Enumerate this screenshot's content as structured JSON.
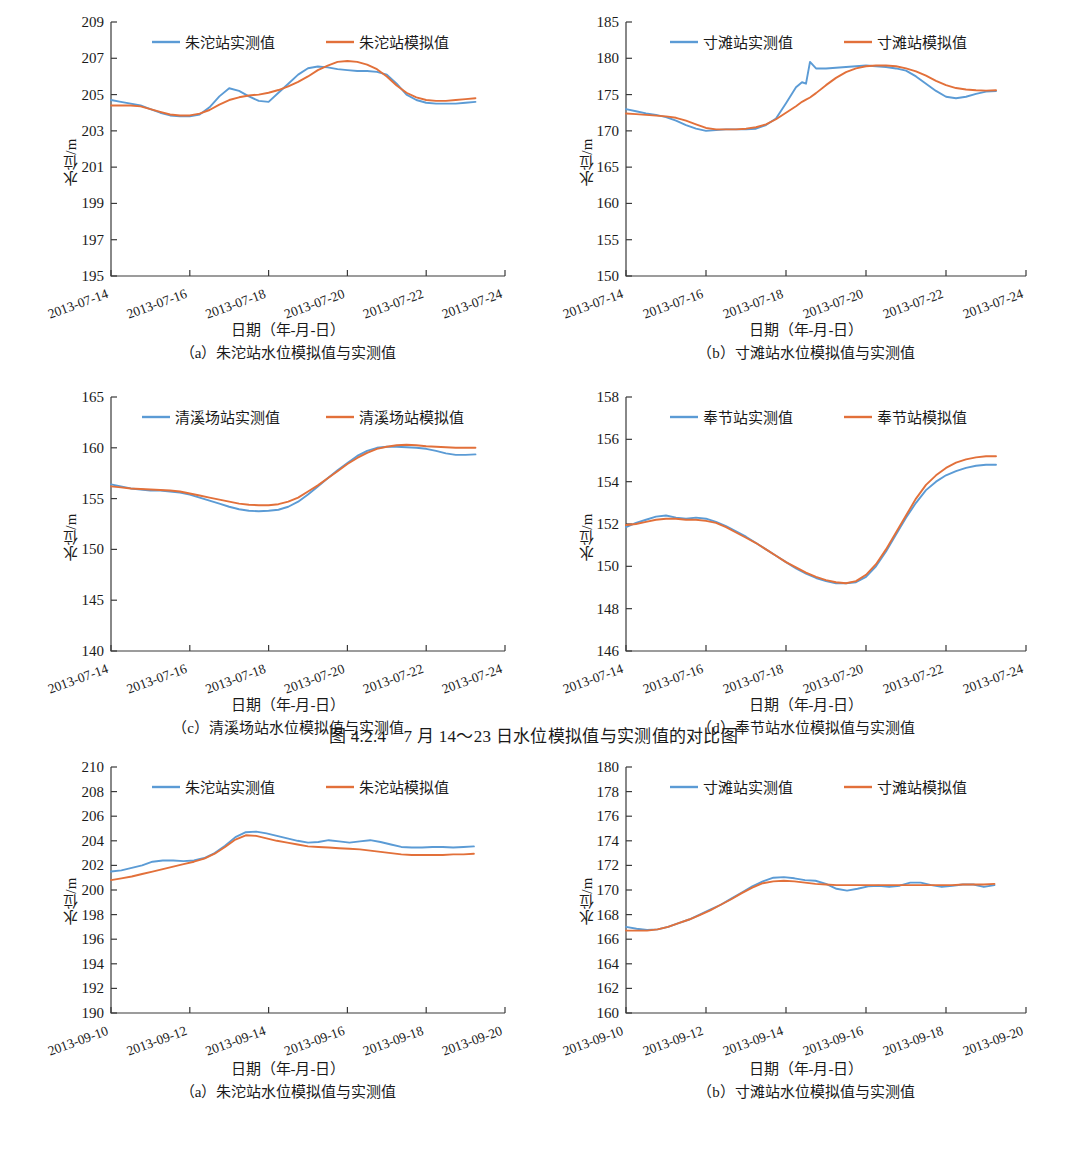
{
  "figure": {
    "title": "图 4.2.4　7 月 14～23 日水位模拟值与实测值的对比图",
    "axis_y_title": "水位/m",
    "axis_x_title": "日期（年-月-日）",
    "colors": {
      "observed": "#5B9BD5",
      "simulated": "#E2703A"
    }
  },
  "chart_data": [
    {
      "id": "a-zhutuo-july",
      "type": "line",
      "title": "",
      "caption": "（a）朱沱站水位模拟值与实测值",
      "xlabel": "日期（年-月-日）",
      "ylabel": "水位/m",
      "legend_position": "top-center",
      "grid": false,
      "ylim": [
        195,
        209
      ],
      "yticks": [
        195,
        197,
        199,
        201,
        203,
        205,
        207,
        209
      ],
      "xlim": [
        "2013-07-14",
        "2013-07-24"
      ],
      "xticks": [
        "2013-07-14",
        "2013-07-16",
        "2013-07-18",
        "2013-07-20",
        "2013-07-22",
        "2013-07-24"
      ],
      "x": [
        0,
        0.25,
        0.5,
        0.75,
        1,
        1.25,
        1.5,
        1.75,
        2,
        2.25,
        2.5,
        2.75,
        3,
        3.25,
        3.5,
        3.75,
        4,
        4.25,
        4.5,
        4.75,
        5,
        5.25,
        5.5,
        5.75,
        6,
        6.25,
        6.5,
        6.75,
        7,
        7.25,
        7.5,
        7.75,
        8,
        8.25,
        8.5,
        8.75,
        9,
        9.25
      ],
      "series": [
        {
          "name": "朱沱站实测值",
          "color": "#5B9BD5",
          "values": [
            204.7,
            204.6,
            204.5,
            204.4,
            204.2,
            204.0,
            203.85,
            203.8,
            203.8,
            203.9,
            204.3,
            204.9,
            205.35,
            205.2,
            204.9,
            204.65,
            204.6,
            205.1,
            205.6,
            206.1,
            206.45,
            206.55,
            206.5,
            206.4,
            206.35,
            206.3,
            206.3,
            206.25,
            206.1,
            205.6,
            205.0,
            204.7,
            204.55,
            204.5,
            204.5,
            204.5,
            204.55,
            204.6
          ]
        },
        {
          "name": "朱沱站模拟值",
          "color": "#E2703A",
          "values": [
            204.4,
            204.4,
            204.4,
            204.35,
            204.2,
            204.05,
            203.9,
            203.85,
            203.85,
            203.95,
            204.15,
            204.45,
            204.7,
            204.85,
            204.95,
            205.0,
            205.1,
            205.25,
            205.45,
            205.7,
            206.0,
            206.35,
            206.6,
            206.8,
            206.85,
            206.8,
            206.65,
            206.4,
            206.0,
            205.5,
            205.1,
            204.85,
            204.7,
            204.65,
            204.65,
            204.7,
            204.75,
            204.8
          ]
        }
      ]
    },
    {
      "id": "b-cuntan-july",
      "type": "line",
      "title": "",
      "caption": "（b）寸滩站水位模拟值与实测值",
      "xlabel": "日期（年-月-日）",
      "ylabel": "水位/m",
      "legend_position": "top-center",
      "grid": false,
      "ylim": [
        150,
        185
      ],
      "yticks": [
        150,
        155,
        160,
        165,
        170,
        175,
        180,
        185
      ],
      "xlim": [
        "2013-07-14",
        "2013-07-24"
      ],
      "xticks": [
        "2013-07-14",
        "2013-07-16",
        "2013-07-18",
        "2013-07-20",
        "2013-07-22",
        "2013-07-24"
      ],
      "x": [
        0,
        0.25,
        0.5,
        0.75,
        1,
        1.25,
        1.5,
        1.75,
        2,
        2.25,
        2.5,
        2.75,
        3,
        3.25,
        3.5,
        3.75,
        4,
        4.25,
        4.4,
        4.5,
        4.6,
        4.75,
        5,
        5.25,
        5.5,
        5.75,
        6,
        6.25,
        6.5,
        6.75,
        7,
        7.25,
        7.5,
        7.75,
        8,
        8.25,
        8.5,
        8.75,
        9,
        9.25
      ],
      "series": [
        {
          "name": "寸滩站实测值",
          "color": "#5B9BD5",
          "values": [
            173.0,
            172.7,
            172.4,
            172.2,
            171.9,
            171.4,
            170.8,
            170.3,
            170.0,
            170.1,
            170.2,
            170.2,
            170.2,
            170.3,
            170.8,
            171.7,
            173.8,
            176.0,
            176.7,
            176.5,
            179.5,
            178.6,
            178.6,
            178.7,
            178.8,
            178.9,
            179.0,
            178.9,
            178.8,
            178.6,
            178.3,
            177.5,
            176.5,
            175.5,
            174.7,
            174.5,
            174.7,
            175.1,
            175.4,
            175.5
          ]
        },
        {
          "name": "寸滩站模拟值",
          "color": "#E2703A",
          "values": [
            172.4,
            172.3,
            172.2,
            172.1,
            172.0,
            171.8,
            171.4,
            170.9,
            170.4,
            170.2,
            170.2,
            170.2,
            170.3,
            170.5,
            170.9,
            171.6,
            172.5,
            173.4,
            174.0,
            174.3,
            174.6,
            175.2,
            176.3,
            177.3,
            178.1,
            178.6,
            178.9,
            179.0,
            179.0,
            178.9,
            178.6,
            178.2,
            177.6,
            176.9,
            176.3,
            175.9,
            175.7,
            175.6,
            175.55,
            175.6
          ]
        }
      ]
    },
    {
      "id": "c-qingxichang-july",
      "type": "line",
      "title": "",
      "caption": "（c）清溪场站水位模拟值与实测值",
      "xlabel": "日期（年-月-日）",
      "ylabel": "水位/m",
      "legend_position": "top-center",
      "grid": false,
      "ylim": [
        140,
        165
      ],
      "yticks": [
        140,
        145,
        150,
        155,
        160,
        165
      ],
      "xlim": [
        "2013-07-14",
        "2013-07-24"
      ],
      "xticks": [
        "2013-07-14",
        "2013-07-16",
        "2013-07-18",
        "2013-07-20",
        "2013-07-22",
        "2013-07-24"
      ],
      "x": [
        0,
        0.25,
        0.5,
        0.75,
        1,
        1.25,
        1.5,
        1.75,
        2,
        2.25,
        2.5,
        2.75,
        3,
        3.25,
        3.5,
        3.75,
        4,
        4.25,
        4.5,
        4.75,
        5,
        5.25,
        5.5,
        5.75,
        6,
        6.25,
        6.5,
        6.75,
        7,
        7.25,
        7.5,
        7.75,
        8,
        8.25,
        8.5,
        8.75,
        9,
        9.25
      ],
      "series": [
        {
          "name": "清溪场站实测值",
          "color": "#5B9BD5",
          "values": [
            156.4,
            156.2,
            156.0,
            155.9,
            155.8,
            155.8,
            155.7,
            155.6,
            155.4,
            155.1,
            154.8,
            154.5,
            154.2,
            153.95,
            153.8,
            153.75,
            153.8,
            153.9,
            154.2,
            154.7,
            155.4,
            156.2,
            157.0,
            157.8,
            158.5,
            159.2,
            159.7,
            160.0,
            160.1,
            160.1,
            160.05,
            160.0,
            159.9,
            159.7,
            159.45,
            159.3,
            159.3,
            159.35
          ]
        },
        {
          "name": "清溪场站模拟值",
          "color": "#E2703A",
          "values": [
            156.2,
            156.1,
            156.0,
            155.95,
            155.9,
            155.85,
            155.8,
            155.7,
            155.5,
            155.3,
            155.1,
            154.9,
            154.7,
            154.5,
            154.4,
            154.35,
            154.35,
            154.45,
            154.7,
            155.1,
            155.7,
            156.3,
            157.0,
            157.7,
            158.4,
            159.0,
            159.5,
            159.9,
            160.1,
            160.25,
            160.3,
            160.25,
            160.15,
            160.1,
            160.05,
            160.0,
            160.0,
            160.0
          ]
        }
      ]
    },
    {
      "id": "d-fengjie-july",
      "type": "line",
      "title": "",
      "caption": "（d）奉节站水位模拟值与实测值",
      "xlabel": "日期（年-月-日）",
      "ylabel": "水位/m",
      "legend_position": "top-center",
      "grid": false,
      "ylim": [
        146,
        158
      ],
      "yticks": [
        146,
        148,
        150,
        152,
        154,
        156,
        158
      ],
      "xlim": [
        "2013-07-14",
        "2013-07-24"
      ],
      "xticks": [
        "2013-07-14",
        "2013-07-16",
        "2013-07-18",
        "2013-07-20",
        "2013-07-22",
        "2013-07-24"
      ],
      "x": [
        0,
        0.25,
        0.5,
        0.75,
        1,
        1.25,
        1.5,
        1.75,
        2,
        2.25,
        2.5,
        2.75,
        3,
        3.25,
        3.5,
        3.75,
        4,
        4.25,
        4.5,
        4.75,
        5,
        5.25,
        5.5,
        5.75,
        6,
        6.25,
        6.5,
        6.75,
        7,
        7.25,
        7.5,
        7.75,
        8,
        8.25,
        8.5,
        8.75,
        9,
        9.25
      ],
      "series": [
        {
          "name": "奉节站实测值",
          "color": "#5B9BD5",
          "values": [
            151.85,
            152.05,
            152.2,
            152.35,
            152.4,
            152.3,
            152.25,
            152.3,
            152.25,
            152.1,
            151.9,
            151.65,
            151.4,
            151.1,
            150.8,
            150.5,
            150.2,
            149.9,
            149.65,
            149.45,
            149.3,
            149.2,
            149.2,
            149.25,
            149.5,
            150.0,
            150.7,
            151.5,
            152.3,
            153.0,
            153.6,
            154.0,
            154.3,
            154.5,
            154.65,
            154.75,
            154.8,
            154.8
          ]
        },
        {
          "name": "奉节站模拟值",
          "color": "#E2703A",
          "values": [
            151.95,
            152.0,
            152.1,
            152.2,
            152.25,
            152.25,
            152.2,
            152.2,
            152.15,
            152.05,
            151.85,
            151.6,
            151.35,
            151.1,
            150.8,
            150.5,
            150.2,
            149.95,
            149.7,
            149.5,
            149.35,
            149.25,
            149.2,
            149.3,
            149.6,
            150.1,
            150.8,
            151.6,
            152.4,
            153.2,
            153.85,
            154.3,
            154.65,
            154.9,
            155.05,
            155.15,
            155.2,
            155.2
          ]
        }
      ]
    },
    {
      "id": "a-zhutuo-september",
      "type": "line",
      "title": "",
      "caption": "（a）朱沱站水位模拟值与实测值",
      "xlabel": "日期（年-月-日）",
      "ylabel": "水位/m",
      "legend_position": "top-center",
      "grid": false,
      "ylim": [
        190,
        210
      ],
      "yticks": [
        190,
        192,
        194,
        196,
        198,
        200,
        202,
        204,
        206,
        208,
        210
      ],
      "xlim": [
        "2013-09-10",
        "2013-09-20"
      ],
      "xticks": [
        "2013-09-10",
        "2013-09-12",
        "2013-09-14",
        "2013-09-16",
        "2013-09-18",
        "2013-09-20"
      ],
      "x": [
        0,
        0.25,
        0.5,
        0.75,
        1,
        1.25,
        1.5,
        1.75,
        2,
        2.25,
        2.5,
        2.75,
        3,
        3.25,
        3.5,
        3.75,
        4,
        4.25,
        4.5,
        4.75,
        5,
        5.25,
        5.5,
        5.75,
        6,
        6.25,
        6.5,
        6.75,
        7,
        7.25,
        7.5,
        7.75,
        8,
        8.25,
        8.5,
        8.75
      ],
      "series": [
        {
          "name": "朱沱站实测值",
          "color": "#5B9BD5",
          "values": [
            201.5,
            201.6,
            201.8,
            202.0,
            202.3,
            202.4,
            202.4,
            202.35,
            202.4,
            202.6,
            203.0,
            203.6,
            204.3,
            204.7,
            204.75,
            204.6,
            204.4,
            204.2,
            204.0,
            203.85,
            203.9,
            204.05,
            203.95,
            203.85,
            203.95,
            204.05,
            203.9,
            203.7,
            203.5,
            203.45,
            203.45,
            203.5,
            203.5,
            203.45,
            203.5,
            203.55
          ]
        },
        {
          "name": "朱沱站模拟值",
          "color": "#E2703A",
          "values": [
            200.8,
            200.95,
            201.1,
            201.3,
            201.5,
            201.7,
            201.9,
            202.1,
            202.3,
            202.55,
            202.95,
            203.5,
            204.1,
            204.45,
            204.4,
            204.2,
            204.0,
            203.85,
            203.7,
            203.55,
            203.5,
            203.45,
            203.4,
            203.35,
            203.3,
            203.2,
            203.1,
            203.0,
            202.9,
            202.85,
            202.85,
            202.85,
            202.85,
            202.9,
            202.9,
            202.95
          ]
        }
      ]
    },
    {
      "id": "b-cuntan-september",
      "type": "line",
      "title": "",
      "caption": "（b）寸滩站水位模拟值与实测值",
      "xlabel": "日期（年-月-日）",
      "ylabel": "水位/m",
      "legend_position": "top-center",
      "grid": false,
      "ylim": [
        160,
        180
      ],
      "yticks": [
        160,
        162,
        164,
        166,
        168,
        170,
        172,
        174,
        176,
        178,
        180
      ],
      "xlim": [
        "2013-09-10",
        "2013-09-20"
      ],
      "xticks": [
        "2013-09-10",
        "2013-09-12",
        "2013-09-14",
        "2013-09-16",
        "2013-09-18",
        "2013-09-20"
      ],
      "x": [
        0,
        0.25,
        0.5,
        0.75,
        1,
        1.25,
        1.5,
        1.75,
        2,
        2.25,
        2.5,
        2.75,
        3,
        3.25,
        3.5,
        3.75,
        4,
        4.25,
        4.5,
        4.75,
        5,
        5.25,
        5.5,
        5.75,
        6,
        6.25,
        6.5,
        6.75,
        7,
        7.25,
        7.5,
        7.75,
        8,
        8.25,
        8.5,
        8.75
      ],
      "series": [
        {
          "name": "寸滩站实测值",
          "color": "#5B9BD5",
          "values": [
            167.0,
            166.85,
            166.75,
            166.8,
            167.0,
            167.3,
            167.6,
            168.0,
            168.4,
            168.8,
            169.3,
            169.8,
            170.3,
            170.7,
            171.0,
            171.05,
            170.95,
            170.8,
            170.75,
            170.5,
            170.1,
            169.95,
            170.1,
            170.3,
            170.35,
            170.25,
            170.35,
            170.6,
            170.6,
            170.4,
            170.25,
            170.35,
            170.45,
            170.45,
            170.25,
            170.4
          ]
        },
        {
          "name": "寸滩站模拟值",
          "color": "#E2703A",
          "values": [
            166.7,
            166.7,
            166.7,
            166.8,
            167.0,
            167.3,
            167.6,
            167.95,
            168.35,
            168.8,
            169.25,
            169.75,
            170.2,
            170.55,
            170.7,
            170.75,
            170.7,
            170.6,
            170.5,
            170.45,
            170.4,
            170.4,
            170.4,
            170.4,
            170.4,
            170.4,
            170.4,
            170.4,
            170.4,
            170.4,
            170.4,
            170.4,
            170.45,
            170.45,
            170.45,
            170.5
          ]
        }
      ]
    }
  ]
}
